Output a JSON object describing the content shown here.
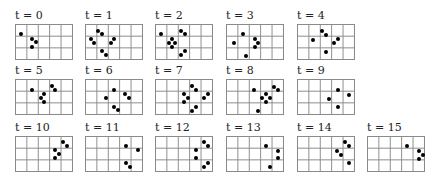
{
  "figure": {
    "grid": {
      "cols": 5,
      "rows": 3,
      "width": 58,
      "height": 36
    },
    "panels": [
      {
        "label": "t = 0",
        "x": 15,
        "y": 10,
        "dots": [
          [
            6,
            10
          ],
          [
            17,
            15
          ],
          [
            21,
            18
          ],
          [
            17,
            23
          ]
        ]
      },
      {
        "label": "t = 1",
        "x": 85,
        "y": 10,
        "dots": [
          [
            13,
            7
          ],
          [
            17,
            10
          ],
          [
            6,
            15
          ],
          [
            9,
            19
          ],
          [
            29,
            15
          ],
          [
            26,
            19
          ],
          [
            17,
            27
          ],
          [
            21,
            31
          ]
        ]
      },
      {
        "label": "t = 2",
        "x": 155,
        "y": 10,
        "dots": [
          [
            6,
            10
          ],
          [
            26,
            7
          ],
          [
            30,
            10
          ],
          [
            17,
            15
          ],
          [
            14,
            19
          ],
          [
            20,
            19
          ],
          [
            17,
            23
          ],
          [
            30,
            27
          ],
          [
            26,
            31
          ]
        ]
      },
      {
        "label": "t = 3",
        "x": 226,
        "y": 10,
        "dots": [
          [
            17,
            10
          ],
          [
            8,
            19
          ],
          [
            29,
            15
          ],
          [
            32,
            19
          ],
          [
            29,
            23
          ],
          [
            20,
            32
          ]
        ]
      },
      {
        "label": "t = 4",
        "x": 297,
        "y": 10,
        "dots": [
          [
            25,
            7
          ],
          [
            29,
            11
          ],
          [
            16,
            16
          ],
          [
            41,
            15
          ],
          [
            37,
            19
          ],
          [
            29,
            28
          ]
        ]
      },
      {
        "label": "t = 5",
        "x": 15,
        "y": 65,
        "dots": [
          [
            17,
            11
          ],
          [
            37,
            7
          ],
          [
            40,
            11
          ],
          [
            29,
            15
          ],
          [
            26,
            19
          ],
          [
            29,
            23
          ]
        ]
      },
      {
        "label": "t = 6",
        "x": 85,
        "y": 65,
        "dots": [
          [
            29,
            11
          ],
          [
            21,
            19
          ],
          [
            40,
            15
          ],
          [
            44,
            19
          ],
          [
            29,
            28
          ],
          [
            33,
            31
          ]
        ]
      },
      {
        "label": "t = 7",
        "x": 155,
        "y": 65,
        "dots": [
          [
            37,
            7
          ],
          [
            41,
            11
          ],
          [
            29,
            15
          ],
          [
            33,
            19
          ],
          [
            29,
            23
          ],
          [
            53,
            15
          ],
          [
            49,
            19
          ],
          [
            41,
            28
          ],
          [
            37,
            32
          ]
        ]
      },
      {
        "label": "t = 8",
        "x": 226,
        "y": 65,
        "dots": [
          [
            28,
            11
          ],
          [
            48,
            8
          ],
          [
            52,
            11
          ],
          [
            40,
            15
          ],
          [
            36,
            19
          ],
          [
            44,
            19
          ],
          [
            40,
            23
          ],
          [
            32,
            32
          ]
        ]
      },
      {
        "label": "t = 9",
        "x": 297,
        "y": 65,
        "dots": [
          [
            41,
            11
          ],
          [
            52,
            16
          ],
          [
            32,
            20
          ],
          [
            41,
            28
          ]
        ]
      },
      {
        "label": "t = 10",
        "x": 15,
        "y": 122,
        "dots": [
          [
            48,
            6
          ],
          [
            52,
            10
          ],
          [
            40,
            14
          ],
          [
            44,
            18
          ],
          [
            40,
            22
          ]
        ]
      },
      {
        "label": "t = 11",
        "x": 85,
        "y": 122,
        "dots": [
          [
            41,
            10
          ],
          [
            53,
            14
          ],
          [
            41,
            27
          ],
          [
            45,
            31
          ]
        ]
      },
      {
        "label": "t = 12",
        "x": 155,
        "y": 122,
        "dots": [
          [
            49,
            6
          ],
          [
            53,
            10
          ],
          [
            41,
            14
          ],
          [
            41,
            22
          ],
          [
            53,
            27
          ],
          [
            49,
            31
          ]
        ]
      },
      {
        "label": "t = 13",
        "x": 226,
        "y": 122,
        "dots": [
          [
            40,
            10
          ],
          [
            52,
            15
          ],
          [
            52,
            22
          ],
          [
            44,
            31
          ]
        ]
      },
      {
        "label": "t = 14",
        "x": 297,
        "y": 122,
        "dots": [
          [
            48,
            6
          ],
          [
            52,
            10
          ],
          [
            40,
            15
          ],
          [
            44,
            19
          ],
          [
            52,
            27
          ]
        ]
      },
      {
        "label": "t = 15",
        "x": 367,
        "y": 122,
        "dots": [
          [
            40,
            10
          ],
          [
            52,
            15
          ],
          [
            56,
            19
          ],
          [
            52,
            23
          ]
        ]
      }
    ]
  }
}
